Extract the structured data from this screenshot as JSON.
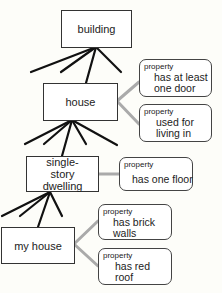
{
  "diagram": {
    "type": "concept-hierarchy",
    "colors": {
      "background": "#fdfdf9",
      "isa_line": "#111111",
      "property_line": "#aaaaaa",
      "border": "#333333"
    },
    "nodes": {
      "building": {
        "label": "building"
      },
      "house": {
        "label": "house"
      },
      "single_story": {
        "label": "single-story dwelling"
      },
      "my_house": {
        "label": "my house"
      }
    },
    "properties": [
      {
        "tag": "property",
        "value": "has at least one door",
        "attached_to": "house"
      },
      {
        "tag": "property",
        "value": "used for living in",
        "attached_to": "house"
      },
      {
        "tag": "property",
        "value": "has one floor",
        "attached_to": "single-story dwelling"
      },
      {
        "tag": "property",
        "value": "has brick walls",
        "attached_to": "my house"
      },
      {
        "tag": "property",
        "value": "has red roof",
        "attached_to": "my house"
      }
    ]
  }
}
